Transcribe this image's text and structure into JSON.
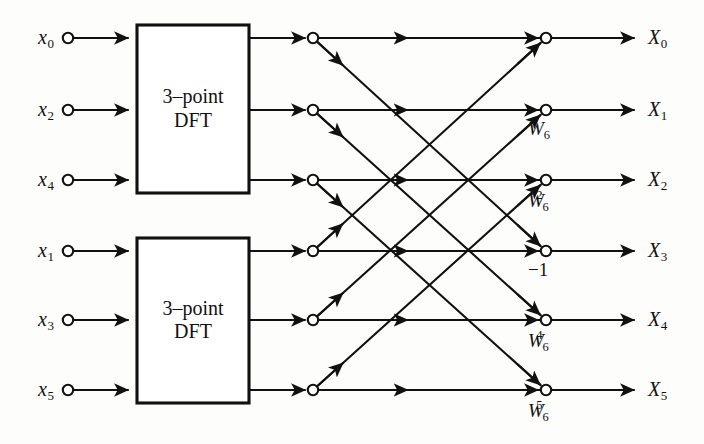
{
  "diagram": {
    "stroke_color": "#111111",
    "background_color": "#fdfdfb",
    "node_fill": "#ffffff",
    "rows_y": [
      38,
      110,
      180,
      251,
      320,
      390
    ],
    "columns": {
      "input_node_x": 68,
      "box_left_x": 137,
      "box_right_x": 249,
      "mid_node_x": 313,
      "out_node_x": 546,
      "out_label_x": 648,
      "line_end_x": 636
    },
    "inputs": [
      {
        "name": "x",
        "index": "0"
      },
      {
        "name": "x",
        "index": "2"
      },
      {
        "name": "x",
        "index": "4"
      },
      {
        "name": "x",
        "index": "1"
      },
      {
        "name": "x",
        "index": "3"
      },
      {
        "name": "x",
        "index": "5"
      }
    ],
    "outputs": [
      {
        "name": "X",
        "index": "0"
      },
      {
        "name": "X",
        "index": "1"
      },
      {
        "name": "X",
        "index": "2"
      },
      {
        "name": "X",
        "index": "3"
      },
      {
        "name": "X",
        "index": "4"
      },
      {
        "name": "X",
        "index": "5"
      }
    ],
    "blocks": [
      {
        "line1": "3–point",
        "line2": "DFT",
        "rows": [
          0,
          1,
          2
        ]
      },
      {
        "line1": "3–point",
        "line2": "DFT",
        "rows": [
          3,
          4,
          5
        ]
      }
    ],
    "twiddles": [
      {
        "row": 0,
        "base": "",
        "sub": "",
        "sup": "",
        "text": ""
      },
      {
        "row": 1,
        "base": "W",
        "sub": "6",
        "sup": "",
        "text": "W6"
      },
      {
        "row": 2,
        "base": "W",
        "sub": "6",
        "sup": "2",
        "text": "W6^2"
      },
      {
        "row": 3,
        "base": "−1",
        "sub": "",
        "sup": "",
        "text": "-1"
      },
      {
        "row": 4,
        "base": "W",
        "sub": "6",
        "sup": "4",
        "text": "W6^4"
      },
      {
        "row": 5,
        "base": "W",
        "sub": "6",
        "sup": "5",
        "text": "W6^5"
      }
    ],
    "butterfly_edges": [
      {
        "from_row": 0,
        "to_row": 3,
        "kind": "descending"
      },
      {
        "from_row": 1,
        "to_row": 4,
        "kind": "descending"
      },
      {
        "from_row": 2,
        "to_row": 5,
        "kind": "descending"
      },
      {
        "from_row": 3,
        "to_row": 0,
        "kind": "ascending"
      },
      {
        "from_row": 4,
        "to_row": 1,
        "kind": "ascending"
      },
      {
        "from_row": 5,
        "to_row": 2,
        "kind": "ascending"
      }
    ],
    "straight_edges": [
      {
        "from_row": 0,
        "to_row": 0
      },
      {
        "from_row": 1,
        "to_row": 1
      },
      {
        "from_row": 2,
        "to_row": 2
      },
      {
        "from_row": 3,
        "to_row": 3
      },
      {
        "from_row": 4,
        "to_row": 4
      },
      {
        "from_row": 5,
        "to_row": 5
      }
    ]
  }
}
